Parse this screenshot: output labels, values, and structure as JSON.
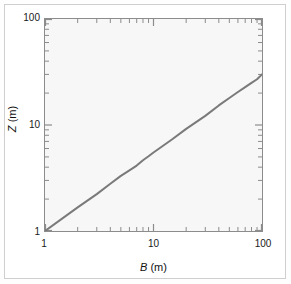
{
  "figure": {
    "background_color": "#ffffff",
    "frame_color": "#cfcfcf",
    "plot_background_color": "#f7f7f7",
    "axis_color": "#8c8c8c",
    "line_color": "#7a7a7a"
  },
  "axis_titles": {
    "x_symbol": "B",
    "x_unit": " (m)",
    "y_symbol": "Z",
    "y_unit": " (m)"
  },
  "x_ticks": {
    "labels": [
      "1",
      "10",
      "100"
    ],
    "values": [
      1,
      10,
      100
    ]
  },
  "y_ticks": {
    "labels": [
      "1",
      "10",
      "100"
    ],
    "values": [
      1,
      10,
      100
    ]
  },
  "chart_data": {
    "type": "line",
    "title": "",
    "subtitle": "",
    "xlabel": "B (m)",
    "ylabel": "Z (m)",
    "xscale": "log",
    "yscale": "log",
    "xlim": [
      1,
      100
    ],
    "ylim": [
      1,
      100
    ],
    "grid": false,
    "legend": null,
    "legend_position": "none",
    "xticks": [
      1,
      10,
      100
    ],
    "xticklabels": [
      "1",
      "10",
      "100"
    ],
    "yticks": [
      1,
      10,
      100
    ],
    "yticklabels": [
      "1",
      "10",
      "100"
    ],
    "minor_ticks": true,
    "tick_direction": "in",
    "series": [
      {
        "name": "Z vs B",
        "color": "#7a7a7a",
        "linewidth": 2,
        "relation": "Z = B^0.74",
        "x": [
          1,
          2,
          3,
          4,
          5,
          6,
          7,
          8,
          9,
          10,
          15,
          20,
          30,
          40,
          50,
          60,
          70,
          80,
          90,
          100
        ],
        "y": [
          1.0,
          1.67,
          2.23,
          2.79,
          3.31,
          3.73,
          4.14,
          4.65,
          5.07,
          5.5,
          7.38,
          9.2,
          12.2,
          15.3,
          18.0,
          20.5,
          22.8,
          25.0,
          27.0,
          30.0
        ]
      }
    ]
  }
}
